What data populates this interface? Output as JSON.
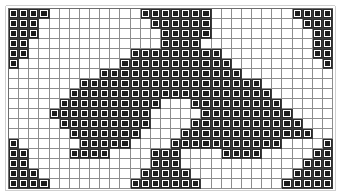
{
  "chart_data": {
    "type": "heatmap",
    "title": "",
    "xlabel": "",
    "ylabel": "",
    "columns": 32,
    "rows": 18,
    "legend": [
      {
        "symbol": "filled-square",
        "meaning": "stitch",
        "color": "#1c1c1c"
      },
      {
        "symbol": "empty-square",
        "meaning": "blank",
        "color": "#ffffff"
      }
    ],
    "grid_colors": {
      "cell_fill": "#1c1c1c",
      "cell_empty": "#ffffff",
      "gridline": "#8d8d8d",
      "border": "#6e6e6e",
      "background": "#ffffff"
    },
    "grid": [
      "11110000000001111111000000001111",
      "11100000000000111111000000000111",
      "11100000000000011111000000000011",
      "11000000000000011110000000000011",
      "11000000000011111111100000000011",
      "10000000000111111111110000000001",
      "00000000011111111111111000000000",
      "00000001111111111111111110000000",
      "00000011111111111111111111000000",
      "00000111111111100011111111100000",
      "00001111111111000001111111110000",
      "00000111111111000011111111111000",
      "00000011111110000111111111111100",
      "10000001111100001111111111100001",
      "11000011110000111000011110000011",
      "11000000000000111000000000000111",
      "11100000000001111100000000001111",
      "11110000000011111110000000011111"
    ]
  }
}
